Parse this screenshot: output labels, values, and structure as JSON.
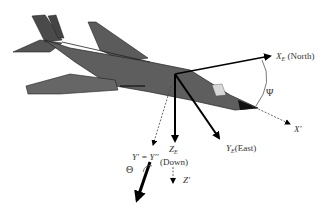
{
  "diagram": {
    "labels": {
      "xe": "X",
      "xe_sub": "E",
      "xe_dir": "(North)",
      "ye": "Y",
      "ye_sub": "E",
      "ye_dir": "(East)",
      "ze": "Z",
      "ze_sub": "E",
      "ze_dir": "(Down)",
      "psi": "Ψ",
      "theta": "Θ",
      "xprime": "X'",
      "zprime": "Z'",
      "yprime": "Y' = Y''"
    },
    "colors": {
      "aircraft": "#5a5a5a",
      "aircraft_dark": "#3c3c3c",
      "axis": "#000000",
      "text": "#333333"
    }
  }
}
